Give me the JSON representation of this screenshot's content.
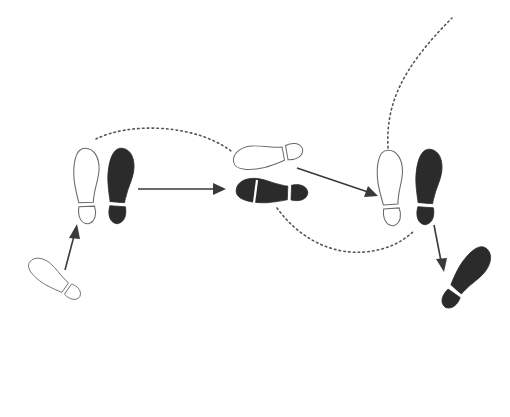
{
  "diagram": {
    "title": "",
    "colors": {
      "background": "#ffffff",
      "filled_shoe": "#2b2b2b",
      "outline_shoe_stroke": "#6a6a6a",
      "arrow": "#3a3a3a",
      "dotted_path": "#555555"
    },
    "footprints": [
      {
        "id": "fp1",
        "style": "outline",
        "label": "start-outline-foot",
        "step": 1
      },
      {
        "id": "fp2",
        "style": "outline",
        "label": "outline-foot-step-2",
        "step": 2
      },
      {
        "id": "fp3",
        "style": "filled",
        "label": "filled-foot-step-2",
        "step": 2
      },
      {
        "id": "fp4",
        "style": "outline",
        "label": "outline-foot-step-3",
        "step": 3
      },
      {
        "id": "fp5",
        "style": "filled",
        "label": "filled-foot-step-3",
        "step": 3
      },
      {
        "id": "fp6",
        "style": "outline",
        "label": "outline-foot-step-4",
        "step": 4
      },
      {
        "id": "fp7",
        "style": "filled",
        "label": "filled-foot-step-4",
        "step": 4
      },
      {
        "id": "fp8",
        "style": "filled",
        "label": "filled-foot-step-5",
        "step": 5
      }
    ],
    "arrows": [
      {
        "from": "fp1",
        "to": "fp2"
      },
      {
        "from": "fp3",
        "to": "fp5"
      },
      {
        "from": "fp4",
        "to": "fp6"
      },
      {
        "from": "fp7",
        "to": "fp8"
      }
    ],
    "dotted_paths": [
      {
        "from": "fp2",
        "to": "fp4",
        "kind": "arc-over"
      },
      {
        "from": "fp5",
        "to": "fp6",
        "kind": "arc-under"
      },
      {
        "from": "fp6",
        "to": "off-canvas-top-right",
        "kind": "sweep-up"
      }
    ]
  }
}
